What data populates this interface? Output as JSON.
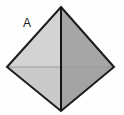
{
  "figure": {
    "name": "octahedron-pyramid-diagram",
    "label": "A",
    "background_color": "#fefefe",
    "outline_color": "#1c1c1c",
    "outline_width": 2,
    "center_edge_color": "#151515",
    "center_edge_width": 2,
    "horizontal_edge_color": "#9a9a9a",
    "horizontal_edge_width": 1,
    "vertices": {
      "apex": {
        "x": 61,
        "y": 7
      },
      "left": {
        "x": 7,
        "y": 67
      },
      "right": {
        "x": 114,
        "y": 67
      },
      "bottom": {
        "x": 61,
        "y": 111
      },
      "center": {
        "x": 61,
        "y": 67
      }
    },
    "faces": [
      {
        "name": "upper-left-face",
        "fill": "#d3d3d3",
        "points": "61,7 7,67 61,67"
      },
      {
        "name": "upper-right-face",
        "fill": "#a6a6a6",
        "points": "61,7 114,67 61,67"
      },
      {
        "name": "lower-left-face",
        "fill": "#cacaca",
        "points": "7,67 61,111 61,67"
      },
      {
        "name": "lower-right-face",
        "fill": "#a3a3a3",
        "points": "114,67 61,111 61,67"
      }
    ],
    "label_position": {
      "x": 23,
      "y": 27
    }
  }
}
